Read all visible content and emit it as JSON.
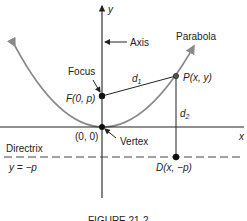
{
  "diagram": {
    "axis_x_label": "x",
    "axis_y_label": "y",
    "axis_label": "Axis",
    "parabola_label": "Parabola",
    "focus_label": "Focus",
    "focus_point": "F(0, p)",
    "point_p": "P(x, y)",
    "d1": "d",
    "d1_sub": "1",
    "d2": "d",
    "d2_sub": "2",
    "origin": "(0, 0)",
    "vertex_label": "Vertex",
    "directrix_label": "Directrix",
    "directrix_eq": "y = −p",
    "point_d": "D(x, −p)",
    "caption": "FIGURE 21-2"
  },
  "colors": {
    "parabola": "#8a8a8a",
    "ink": "#222222"
  }
}
